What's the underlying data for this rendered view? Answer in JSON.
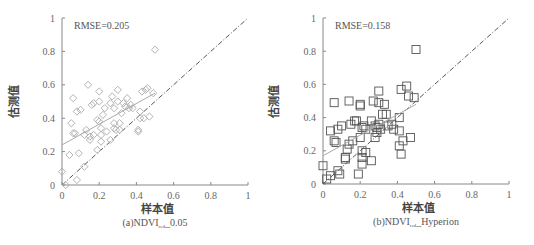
{
  "chart_data": [
    {
      "type": "scatter",
      "panel": "a",
      "caption_prefix": "(a)NDVI",
      "caption_sub": "red",
      "caption_suffix": "_0.05",
      "annotation": "RMSE=0.205",
      "xlabel": "样本值",
      "ylabel": "估测值",
      "xlim": [
        0,
        1
      ],
      "ylim": [
        0,
        1
      ],
      "xticks": [
        "0",
        "0.2",
        "0.4",
        "0.6",
        "0.8",
        "1"
      ],
      "yticks": [
        "0",
        "0.2",
        "0.4",
        "0.6",
        "0.8",
        "1"
      ],
      "marker": "diamond",
      "marker_color": "#aaaaaa",
      "fit_line": {
        "x0": 0,
        "y0": 0.24,
        "x1": 0.5,
        "y1": 0.55,
        "color": "#aaaaaa"
      },
      "reference_line": {
        "type": "1:1",
        "style": "dash-dot",
        "color": "#555555"
      },
      "points": [
        [
          0.0,
          0.08
        ],
        [
          0.02,
          0.0
        ],
        [
          0.04,
          0.18
        ],
        [
          0.05,
          0.37
        ],
        [
          0.06,
          0.31
        ],
        [
          0.06,
          0.52
        ],
        [
          0.07,
          0.31
        ],
        [
          0.08,
          0.03
        ],
        [
          0.08,
          0.44
        ],
        [
          0.09,
          0.19
        ],
        [
          0.1,
          0.45
        ],
        [
          0.12,
          0.11
        ],
        [
          0.12,
          0.3
        ],
        [
          0.13,
          0.33
        ],
        [
          0.14,
          0.6
        ],
        [
          0.15,
          0.29
        ],
        [
          0.15,
          0.27
        ],
        [
          0.16,
          0.48
        ],
        [
          0.17,
          0.3
        ],
        [
          0.17,
          0.49
        ],
        [
          0.19,
          0.39
        ],
        [
          0.19,
          0.21
        ],
        [
          0.2,
          0.38
        ],
        [
          0.2,
          0.5
        ],
        [
          0.2,
          0.56
        ],
        [
          0.21,
          0.34
        ],
        [
          0.21,
          0.3
        ],
        [
          0.21,
          0.26
        ],
        [
          0.22,
          0.42
        ],
        [
          0.23,
          0.46
        ],
        [
          0.24,
          0.32
        ],
        [
          0.26,
          0.49
        ],
        [
          0.26,
          0.27
        ],
        [
          0.27,
          0.53
        ],
        [
          0.28,
          0.46
        ],
        [
          0.28,
          0.37
        ],
        [
          0.28,
          0.34
        ],
        [
          0.29,
          0.33
        ],
        [
          0.3,
          0.57
        ],
        [
          0.3,
          0.5
        ],
        [
          0.31,
          0.37
        ],
        [
          0.31,
          0.33
        ],
        [
          0.32,
          0.43
        ],
        [
          0.33,
          0.49
        ],
        [
          0.34,
          0.47
        ],
        [
          0.35,
          0.52
        ],
        [
          0.36,
          0.46
        ],
        [
          0.37,
          0.48
        ],
        [
          0.38,
          0.46
        ],
        [
          0.41,
          0.32
        ],
        [
          0.41,
          0.33
        ],
        [
          0.42,
          0.4
        ],
        [
          0.42,
          0.44
        ],
        [
          0.43,
          0.56
        ],
        [
          0.44,
          0.4
        ],
        [
          0.45,
          0.57
        ],
        [
          0.46,
          0.58
        ],
        [
          0.47,
          0.41
        ],
        [
          0.49,
          0.55
        ],
        [
          0.5,
          0.81
        ]
      ]
    },
    {
      "type": "scatter",
      "panel": "b",
      "caption_prefix": "(b)NDVI",
      "caption_sub": "red",
      "caption_suffix": "_Hyperion",
      "annotation": "RMSE=0.158",
      "xlabel": "样本值",
      "ylabel": "估测值",
      "xlim": [
        0,
        1
      ],
      "ylim": [
        0,
        1
      ],
      "xticks": [
        "0",
        "0.2",
        "0.4",
        "0.6",
        "0.8",
        "1"
      ],
      "yticks": [
        "0",
        "0.2",
        "0.4",
        "0.6",
        "0.8",
        "1"
      ],
      "marker": "square",
      "marker_color": "#555555",
      "fit_line": {
        "x0": 0,
        "y0": 0.17,
        "x1": 0.5,
        "y1": 0.48,
        "color": "#aaaaaa"
      },
      "reference_line": {
        "type": "1:1",
        "style": "dash-dot",
        "color": "#555555"
      },
      "points": [
        [
          0.0,
          0.11
        ],
        [
          0.02,
          0.03
        ],
        [
          0.04,
          0.05
        ],
        [
          0.04,
          0.32
        ],
        [
          0.06,
          0.49
        ],
        [
          0.06,
          0.26
        ],
        [
          0.07,
          0.25
        ],
        [
          0.08,
          0.33
        ],
        [
          0.08,
          0.08
        ],
        [
          0.09,
          0.06
        ],
        [
          0.1,
          0.35
        ],
        [
          0.12,
          0.16
        ],
        [
          0.12,
          0.15
        ],
        [
          0.13,
          0.21
        ],
        [
          0.14,
          0.5
        ],
        [
          0.14,
          0.24
        ],
        [
          0.15,
          0.36
        ],
        [
          0.16,
          0.26
        ],
        [
          0.17,
          0.38
        ],
        [
          0.18,
          0.38
        ],
        [
          0.19,
          0.06
        ],
        [
          0.2,
          0.28
        ],
        [
          0.2,
          0.48
        ],
        [
          0.2,
          0.47
        ],
        [
          0.21,
          0.2
        ],
        [
          0.21,
          0.16
        ],
        [
          0.21,
          0.12
        ],
        [
          0.21,
          0.34
        ],
        [
          0.22,
          0.35
        ],
        [
          0.23,
          0.19
        ],
        [
          0.23,
          0.33
        ],
        [
          0.26,
          0.38
        ],
        [
          0.26,
          0.14
        ],
        [
          0.27,
          0.5
        ],
        [
          0.28,
          0.28
        ],
        [
          0.28,
          0.35
        ],
        [
          0.29,
          0.34
        ],
        [
          0.29,
          0.31
        ],
        [
          0.3,
          0.56
        ],
        [
          0.3,
          0.49
        ],
        [
          0.3,
          0.36
        ],
        [
          0.31,
          0.33
        ],
        [
          0.32,
          0.42
        ],
        [
          0.33,
          0.48
        ],
        [
          0.34,
          0.42
        ],
        [
          0.35,
          0.35
        ],
        [
          0.37,
          0.36
        ],
        [
          0.38,
          0.33
        ],
        [
          0.41,
          0.23
        ],
        [
          0.41,
          0.32
        ],
        [
          0.41,
          0.4
        ],
        [
          0.42,
          0.18
        ],
        [
          0.42,
          0.57
        ],
        [
          0.43,
          0.26
        ],
        [
          0.45,
          0.59
        ],
        [
          0.46,
          0.53
        ],
        [
          0.47,
          0.28
        ],
        [
          0.49,
          0.52
        ],
        [
          0.5,
          0.81
        ]
      ]
    }
  ]
}
